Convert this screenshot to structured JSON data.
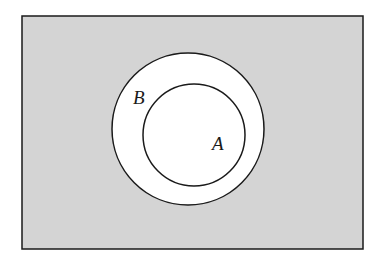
{
  "diagram": {
    "type": "venn",
    "colors": {
      "background": "#ffffff",
      "universe_fill": "#d4d4d4",
      "circle_fill": "#ffffff",
      "stroke": "#1a1a1a"
    },
    "universe": {
      "x": 22,
      "y": 16,
      "width": 341,
      "height": 233
    },
    "sets": [
      {
        "label": "B",
        "cx": 188,
        "cy": 129,
        "r": 76,
        "label_x": 133,
        "label_y": 104
      },
      {
        "label": "A",
        "cx": 194,
        "cy": 135,
        "r": 51,
        "label_x": 212,
        "label_y": 150
      }
    ],
    "relation": "A is a subset of B; region outside B is shaded"
  }
}
